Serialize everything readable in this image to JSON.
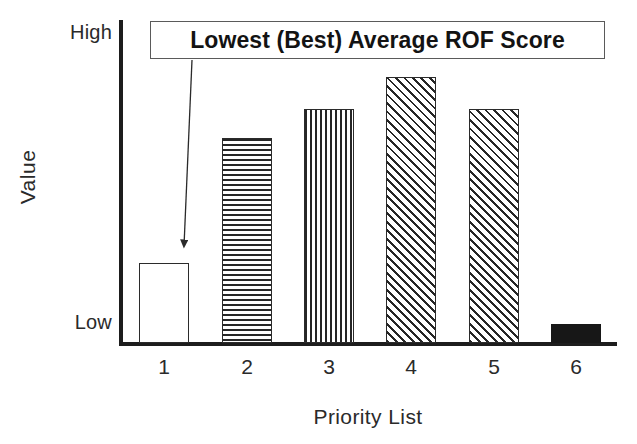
{
  "chart_data": {
    "type": "bar",
    "title": "",
    "xlabel": "Priority List",
    "ylabel": "Value",
    "categories": [
      "1",
      "2",
      "3",
      "4",
      "5",
      "6"
    ],
    "values": [
      25,
      64,
      73,
      83,
      73,
      6
    ],
    "ylim": [
      0,
      100
    ],
    "ytick_labels": [
      "Low",
      "High"
    ],
    "ytick_values": [
      0,
      100
    ],
    "grid": false,
    "legend": false,
    "bar_patterns": [
      "none",
      "horizontal",
      "vertical",
      "diagonal",
      "diagonal",
      "solid"
    ],
    "bar_colors": [
      "#ffffff",
      "#ffffff",
      "#ffffff",
      "#ffffff",
      "#ffffff",
      "#171717"
    ],
    "edge_color": "#2b2b2b",
    "annotations": [
      {
        "text": "Lowest (Best) Average ROF Score",
        "points_to_category": "1",
        "style": "boxed-callout-with-arrow"
      }
    ]
  },
  "axes": {
    "y_high_label": "High",
    "y_low_label": "Low",
    "y_axis_title": "Value",
    "x_axis_title": "Priority List",
    "x_tick_labels": [
      "1",
      "2",
      "3",
      "4",
      "5",
      "6"
    ]
  },
  "callout": {
    "text": "Lowest (Best) Average ROF Score"
  },
  "colors": {
    "axis": "#1d1d1d",
    "text": "#2a2a2a",
    "bar_edge": "#2b2b2b",
    "bar_fill_solid": "#171717",
    "callout_border": "#5a5a5a",
    "background": "#ffffff"
  }
}
